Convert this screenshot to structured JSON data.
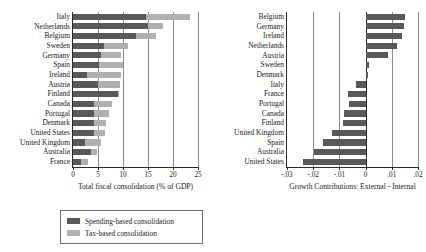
{
  "chart_data": [
    {
      "id": "fiscal-consolidation",
      "type": "bar",
      "orientation": "horizontal",
      "stacked": true,
      "title": "",
      "xlabel": "Total fiscal consolidation (% of GDP)",
      "ylabel": "",
      "xlim": [
        0,
        25
      ],
      "xticks": [
        0,
        5,
        10,
        15,
        20,
        25
      ],
      "xtick_labels": [
        "0",
        "5",
        "10",
        "15",
        "20",
        "25"
      ],
      "grid": true,
      "legend_position": "below-left",
      "categories": [
        "Italy",
        "Netherlands",
        "Belgium",
        "Sweden",
        "Germany",
        "Spain",
        "Ireland",
        "Austria",
        "Finland",
        "Canada",
        "Portugal",
        "Denmark",
        "United States",
        "United Kingdom",
        "Australia",
        "France"
      ],
      "series": [
        {
          "name": "Spending-based consolidation",
          "color": "#595959",
          "values": [
            14.6,
            15.0,
            12.5,
            6.1,
            5.6,
            5.1,
            2.7,
            5.0,
            8.9,
            4.2,
            4.2,
            4.2,
            4.1,
            2.3,
            3.6,
            1.6
          ]
        },
        {
          "name": "Tax-based consolidation",
          "color": "#b0b0b0",
          "values": [
            8.7,
            3.0,
            4.1,
            4.8,
            4.0,
            4.9,
            6.9,
            4.4,
            0.1,
            3.6,
            3.0,
            2.3,
            2.3,
            3.3,
            1.2,
            1.4
          ]
        }
      ]
    },
    {
      "id": "growth-contributions",
      "type": "bar",
      "orientation": "horizontal",
      "stacked": false,
      "title": "",
      "xlabel": "Growth Contributions: External - Internal",
      "ylabel": "",
      "xlim": [
        -0.03,
        0.02
      ],
      "xticks": [
        -0.03,
        -0.02,
        -0.01,
        0,
        0.01,
        0.02
      ],
      "xtick_labels": [
        "-.03",
        "-.02",
        "-.01",
        "0",
        ".01",
        ".02"
      ],
      "grid": true,
      "legend_position": "none",
      "categories": [
        "Belgium",
        "Germany",
        "Ireland",
        "Netherlands",
        "Austria",
        "Sweden",
        "Denmark",
        "Italy",
        "France",
        "Portugal",
        "Canada",
        "Finland",
        "United Kingdom",
        "Spain",
        "Australia",
        "United States"
      ],
      "series": [
        {
          "name": "Growth Contributions: External - Internal",
          "color": "#595959",
          "values": [
            0.0152,
            0.0146,
            0.0139,
            0.0118,
            0.0085,
            0.0012,
            0.0011,
            -0.0036,
            -0.0068,
            -0.0065,
            -0.0083,
            -0.0087,
            -0.0128,
            -0.0163,
            -0.0196,
            -0.024
          ]
        }
      ]
    }
  ],
  "legend": {
    "items": [
      {
        "label": "Spending-based consolidation",
        "color": "#595959"
      },
      {
        "label": "Tax-based consolidation",
        "color": "#b0b0b0"
      }
    ]
  },
  "colors": {
    "spending": "#595959",
    "tax": "#b0b0b0",
    "axis": "#2b2b2b",
    "grid": "#8c8c8c",
    "background": "#ffffff"
  }
}
